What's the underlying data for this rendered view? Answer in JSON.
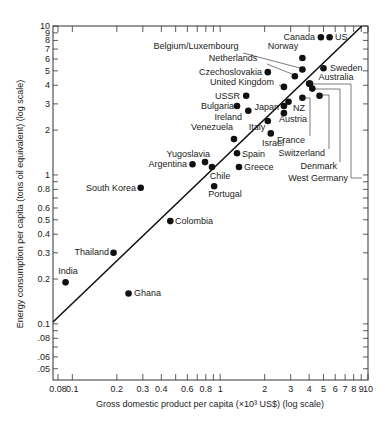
{
  "chart_data": {
    "type": "scatter",
    "title": "",
    "xlabel": "Gross domestic product per capita (×10³ US$) (log scale)",
    "ylabel": "Energy consumption per capita (tons oil equivalent) (log scale)",
    "xscale": "log",
    "yscale": "log",
    "xlim": [
      0.074,
      10
    ],
    "ylim": [
      0.042,
      10
    ],
    "grid": false,
    "legend": "none",
    "x_ticks": [
      {
        "value": 0.08,
        "label": "0.08"
      },
      {
        "value": 0.1,
        "label": "0.1"
      },
      {
        "value": 0.2,
        "label": "0.2"
      },
      {
        "value": 0.3,
        "label": "0.3"
      },
      {
        "value": 0.4,
        "label": "0.4"
      },
      {
        "value": 0.5,
        "label": ""
      },
      {
        "value": 0.6,
        "label": "0.6"
      },
      {
        "value": 0.7,
        "label": ""
      },
      {
        "value": 0.8,
        "label": "0.8"
      },
      {
        "value": 0.9,
        "label": ""
      },
      {
        "value": 1,
        "label": "1"
      },
      {
        "value": 2,
        "label": "2"
      },
      {
        "value": 3,
        "label": "3"
      },
      {
        "value": 4,
        "label": "4"
      },
      {
        "value": 5,
        "label": "5"
      },
      {
        "value": 6,
        "label": "6"
      },
      {
        "value": 7,
        "label": "7"
      },
      {
        "value": 8,
        "label": "8"
      },
      {
        "value": 9,
        "label": "9"
      },
      {
        "value": 10,
        "label": "10"
      }
    ],
    "y_ticks": [
      {
        "value": 0.05,
        "label": ".05"
      },
      {
        "value": 0.06,
        "label": ".06"
      },
      {
        "value": 0.07,
        "label": ""
      },
      {
        "value": 0.08,
        "label": ".08"
      },
      {
        "value": 0.09,
        "label": ""
      },
      {
        "value": 0.1,
        "label": "0.1"
      },
      {
        "value": 0.2,
        "label": "0.2"
      },
      {
        "value": 0.3,
        "label": "0.3"
      },
      {
        "value": 0.4,
        "label": "0.4"
      },
      {
        "value": 0.5,
        "label": "0.5"
      },
      {
        "value": 0.6,
        "label": "0.6"
      },
      {
        "value": 0.7,
        "label": ""
      },
      {
        "value": 0.8,
        "label": "0.8"
      },
      {
        "value": 0.9,
        "label": ""
      },
      {
        "value": 1,
        "label": "1"
      },
      {
        "value": 2,
        "label": "2"
      },
      {
        "value": 3,
        "label": "3"
      },
      {
        "value": 4,
        "label": "4"
      },
      {
        "value": 5,
        "label": "5"
      },
      {
        "value": 6,
        "label": "6"
      },
      {
        "value": 7,
        "label": "7"
      },
      {
        "value": 8,
        "label": "8"
      },
      {
        "value": 9,
        "label": "9"
      },
      {
        "value": 10,
        "label": "10"
      }
    ],
    "fit_line": {
      "x": [
        0.074,
        9.1
      ],
      "y": [
        0.103,
        10.0
      ]
    },
    "points": [
      {
        "name": "Canada",
        "x": 4.8,
        "y": 8.4,
        "label_pos": "left"
      },
      {
        "name": "US",
        "x": 5.5,
        "y": 8.4,
        "label_pos": "right"
      },
      {
        "name": "Norway",
        "x": 3.6,
        "y": 6.1,
        "label_pos": "above"
      },
      {
        "name": "Belgium/Luxembourg",
        "x": 3.6,
        "y": 5.1,
        "label_pos": "leader"
      },
      {
        "name": "Netherlands",
        "x": 3.2,
        "y": 4.6,
        "label_pos": "leader"
      },
      {
        "name": "Czechoslovakia",
        "x": 2.1,
        "y": 4.9,
        "label_pos": "left"
      },
      {
        "name": "Sweden",
        "x": 5.0,
        "y": 5.2,
        "label_pos": "right"
      },
      {
        "name": "Australia",
        "x": 4.0,
        "y": 4.1,
        "label_pos": "above"
      },
      {
        "name": "United Kingdom",
        "x": 2.7,
        "y": 3.9,
        "label_pos": "leader"
      },
      {
        "name": "West Germany",
        "x": 4.05,
        "y": 4.1,
        "label_pos": "bracket"
      },
      {
        "name": "Denmark",
        "x": 4.2,
        "y": 3.8,
        "label_pos": "bracket"
      },
      {
        "name": "Switzerland",
        "x": 4.7,
        "y": 3.4,
        "label_pos": "bracket"
      },
      {
        "name": "France",
        "x": 3.6,
        "y": 3.3,
        "label_pos": "bracket"
      },
      {
        "name": "USSR",
        "x": 1.5,
        "y": 3.4,
        "label_pos": "left"
      },
      {
        "name": "Bulgaria",
        "x": 1.3,
        "y": 2.9,
        "label_pos": "left"
      },
      {
        "name": "Ireland",
        "x": 1.55,
        "y": 2.7,
        "label_pos": "below-left"
      },
      {
        "name": "Japan",
        "x": 2.7,
        "y": 2.9,
        "label_pos": "left"
      },
      {
        "name": "NZ",
        "x": 2.9,
        "y": 3.1,
        "label_pos": "right"
      },
      {
        "name": "Austria",
        "x": 2.7,
        "y": 2.6,
        "label_pos": "below"
      },
      {
        "name": "Italy",
        "x": 2.1,
        "y": 2.3,
        "label_pos": "below-left"
      },
      {
        "name": "Israel",
        "x": 2.2,
        "y": 1.9,
        "label_pos": "below"
      },
      {
        "name": "Venezuela",
        "x": 1.24,
        "y": 1.74,
        "label_pos": "above-left"
      },
      {
        "name": "Spain",
        "x": 1.3,
        "y": 1.4,
        "label_pos": "right"
      },
      {
        "name": "Greece",
        "x": 1.34,
        "y": 1.13,
        "label_pos": "right"
      },
      {
        "name": "Chile",
        "x": 0.88,
        "y": 1.13,
        "label_pos": "below"
      },
      {
        "name": "Yugoslavia",
        "x": 0.79,
        "y": 1.22,
        "label_pos": "above-left"
      },
      {
        "name": "Argentina",
        "x": 0.65,
        "y": 1.18,
        "label_pos": "left"
      },
      {
        "name": "Portugal",
        "x": 0.91,
        "y": 0.84,
        "label_pos": "below"
      },
      {
        "name": "South Korea",
        "x": 0.29,
        "y": 0.82,
        "label_pos": "left"
      },
      {
        "name": "Colombia",
        "x": 0.46,
        "y": 0.49,
        "label_pos": "right"
      },
      {
        "name": "Thailand",
        "x": 0.19,
        "y": 0.3,
        "label_pos": "left"
      },
      {
        "name": "India",
        "x": 0.09,
        "y": 0.19,
        "label_pos": "above"
      },
      {
        "name": "Ghana",
        "x": 0.24,
        "y": 0.16,
        "label_pos": "right"
      }
    ]
  }
}
